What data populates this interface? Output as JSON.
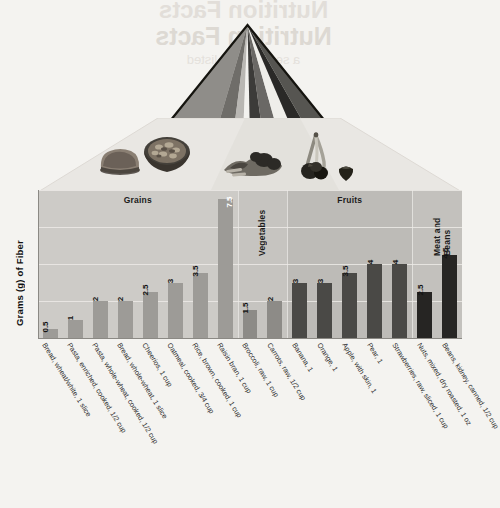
{
  "ghost_text": {
    "line1": "Nutrition Facts",
    "line2": "Nutrition Facts",
    "line3": "a serving size listed"
  },
  "pyramid": {
    "name": "mypyramid-food-guide",
    "stripe_colors": [
      "#9a9a9a",
      "#6e6e6e",
      "#bdbdbd",
      "#4a4a4a",
      "#f2f2f2",
      "#2b2b2b",
      "#8a8a8a",
      "#555555"
    ],
    "outline_color": "#111111"
  },
  "photos": [
    {
      "name": "bread-slice-photo",
      "label": "bread"
    },
    {
      "name": "cereal-bowl-photo",
      "label": "cereal bowl"
    },
    {
      "name": "vegetables-photo",
      "label": "vegetables"
    },
    {
      "name": "banana-photo",
      "label": "banana"
    },
    {
      "name": "berries-photo",
      "label": "berries"
    },
    {
      "name": "strawberry-photo",
      "label": "strawberry"
    }
  ],
  "chart_data": {
    "type": "bar",
    "title": "",
    "xlabel": "",
    "ylabel": "Grams (g) of Fiber",
    "ylim": [
      0,
      8
    ],
    "gridlines": [
      2,
      4,
      6,
      8
    ],
    "grid": true,
    "legend": "none",
    "categories": [
      "Bread, wheat/white, 1 slice",
      "Pasta, enriched, cooked, 1/2 cup",
      "Pasta, whole-wheat, cooked, 1/2 cup",
      "Bread, whole-wheat, 1 slice",
      "Cheerios, 1 cup",
      "Oatmeal, cooked, 3/4 cup",
      "Rice, brown, cooked, 1 cup",
      "Raisin bran, 1 cup",
      "Broccoli, raw, 1 cup",
      "Carrots, raw, 1/2 cup",
      "Banana, 1",
      "Orange, 1",
      "Apple, with skin, 1",
      "Pear, 1",
      "Strawberries, raw, sliced, 1 cup",
      "Nuts, mixed, dry roasted, 1 oz",
      "Beans, kidney, canned, 1/2 cup"
    ],
    "values": [
      0.5,
      1,
      2,
      2,
      2.5,
      3,
      3.5,
      7.5,
      1.5,
      2,
      3,
      3,
      3.5,
      4,
      4,
      2.5,
      4.5
    ],
    "value_labels": [
      "0.5",
      "1",
      "2",
      "2",
      "2.5",
      "3",
      "3.5",
      "7.5",
      "1.5",
      "2",
      "3",
      "3",
      "3.5",
      "4",
      "4",
      "2.5",
      "4.5"
    ],
    "groups": [
      {
        "label": "Grains",
        "start": 0,
        "count": 8,
        "bar_color": "#9d9b97",
        "band_color": "#cdcbc7"
      },
      {
        "label": "Vegetables",
        "start": 8,
        "count": 2,
        "bar_color": "#8d8b87",
        "band_color": "#c6c4c0"
      },
      {
        "label": "Fruits",
        "start": 10,
        "count": 5,
        "bar_color": "#4a4946",
        "band_color": "#bdbbb7"
      },
      {
        "label": "Meat and Beans",
        "start": 15,
        "count": 2,
        "bar_color": "#262523",
        "band_color": "#c3c1bd"
      }
    ]
  }
}
